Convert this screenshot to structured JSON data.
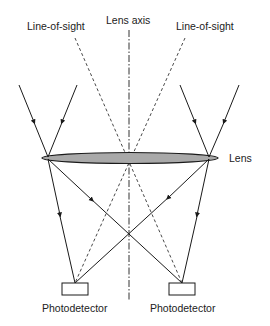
{
  "labels": {
    "line_of_sight_left": "Line-of-sight",
    "lens_axis": "Lens axis",
    "line_of_sight_right": "Line-of-sight",
    "lens": "Lens",
    "photodetector_left": "Photodetector",
    "photodetector_right": "Photodetector"
  },
  "colors": {
    "lens_fill": "#a9a9a9",
    "stroke": "#1a1a1a"
  }
}
